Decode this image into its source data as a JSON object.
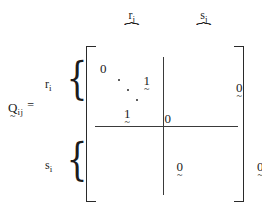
{
  "figure": {
    "type": "block-matrix-equation",
    "lhs": {
      "symbol": "Q",
      "undertilde": "~",
      "subscript": "ij",
      "equals": "="
    },
    "column_groups": [
      {
        "label": "r",
        "sub": "j",
        "brace": "⏞"
      },
      {
        "label": "s",
        "sub": "j",
        "brace": "⏞"
      }
    ],
    "row_groups": [
      {
        "label": "r",
        "sub": "i",
        "brace": "{"
      },
      {
        "label": "s",
        "sub": "i",
        "brace": "{"
      }
    ],
    "brackets": {
      "left": "[",
      "right": "]"
    },
    "blocks": [
      {
        "name": "top-left",
        "content": "anti-diagonal-identity",
        "entries": [
          {
            "value": "0",
            "undertilde": ""
          },
          {
            "value": "1",
            "undertilde": "~"
          },
          {
            "value": "1",
            "undertilde": "~"
          },
          {
            "value": "0",
            "undertilde": ""
          }
        ],
        "dots": 3
      },
      {
        "name": "top-right",
        "content": "zero",
        "entries": [
          {
            "value": "0",
            "undertilde": "~"
          }
        ]
      },
      {
        "name": "bottom-left",
        "content": "zero",
        "entries": [
          {
            "value": "0",
            "undertilde": "~"
          }
        ]
      },
      {
        "name": "bottom-right",
        "content": "zero",
        "entries": [
          {
            "value": "0",
            "undertilde": "~"
          }
        ]
      }
    ],
    "colors": {
      "ink": "#1b1b1b",
      "rule": "#3a3a3a",
      "background": "#ffffff"
    }
  }
}
